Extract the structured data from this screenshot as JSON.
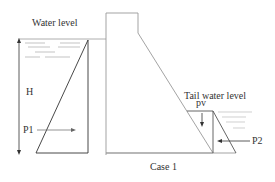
{
  "diagram": {
    "caption": "Case 1",
    "labels": {
      "water_level": "Water level",
      "tail_water_level": "Tail water level",
      "height": "H",
      "upstream_pressure": "P1",
      "downstream_pressure": "P2",
      "vertical_pressure": "pv"
    },
    "colors": {
      "line": "#555555",
      "dam_outline": "#999999",
      "water_lines": "#aaaaaa",
      "text": "#333333"
    }
  }
}
